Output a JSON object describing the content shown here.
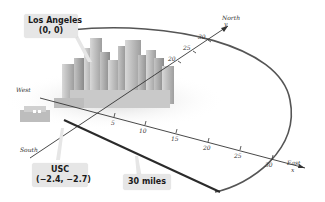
{
  "figure": {
    "title": "",
    "callouts": {
      "origin": {
        "name": "Los Angeles",
        "coords": "(0, 0)"
      },
      "point": {
        "name": "USC",
        "coords": "(−2.4, −2.7)"
      },
      "radius": {
        "label": "30 miles"
      }
    },
    "axes": {
      "x": {
        "positive_label": "East",
        "negative_label": "West",
        "variable": "x",
        "ticks": [
          "5",
          "10",
          "15",
          "20",
          "25",
          "30"
        ]
      },
      "y": {
        "positive_label": "North",
        "negative_label": "South",
        "variable": "y",
        "ticks": [
          "20",
          "25",
          "30"
        ]
      }
    },
    "colors": {
      "axis": "#333333",
      "circle": "#555555",
      "radius_line": "#2a2a2a",
      "callout_bg": "#e6e6e6",
      "buildings": "#b8b8b8"
    }
  }
}
